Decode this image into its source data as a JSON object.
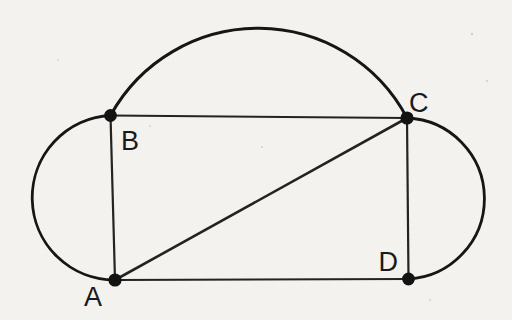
{
  "figure": {
    "labels": {
      "a": "A",
      "b": "B",
      "c": "C",
      "d": "D"
    },
    "vertices": [
      {
        "id": "A",
        "label": "A",
        "position": "bottom-left"
      },
      {
        "id": "B",
        "label": "B",
        "position": "top-left"
      },
      {
        "id": "C",
        "label": "C",
        "position": "top-right"
      },
      {
        "id": "D",
        "label": "D",
        "position": "bottom-right"
      }
    ],
    "elements": [
      "rectangle ABCD",
      "diagonal AC",
      "arc over top from B to C",
      "semicircle on side AB (bulging left)",
      "semicircle on side CD (bulging right)"
    ],
    "colors": {
      "paper": "#f5f4f0",
      "ink": "#1b1b1b"
    }
  }
}
